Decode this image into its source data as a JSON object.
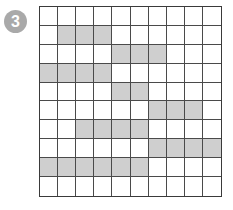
{
  "badge": {
    "label": "3",
    "color": "#a9a9a9"
  },
  "grid": {
    "rows": 10,
    "cols": 10,
    "shade_color": "#cfcfcf",
    "shaded": [
      [
        0,
        0,
        0,
        0,
        0,
        0,
        0,
        0,
        0,
        0
      ],
      [
        0,
        1,
        1,
        1,
        0,
        0,
        0,
        0,
        0,
        0
      ],
      [
        0,
        0,
        0,
        0,
        1,
        1,
        1,
        0,
        0,
        0
      ],
      [
        1,
        1,
        1,
        1,
        0,
        0,
        0,
        0,
        0,
        0
      ],
      [
        0,
        0,
        0,
        0,
        1,
        1,
        0,
        0,
        0,
        0
      ],
      [
        0,
        0,
        0,
        0,
        0,
        0,
        1,
        1,
        1,
        0
      ],
      [
        0,
        0,
        1,
        1,
        1,
        1,
        0,
        0,
        0,
        0
      ],
      [
        0,
        0,
        0,
        0,
        0,
        0,
        1,
        1,
        1,
        1
      ],
      [
        1,
        1,
        1,
        1,
        1,
        1,
        0,
        0,
        0,
        0
      ],
      [
        0,
        0,
        0,
        0,
        0,
        0,
        0,
        0,
        0,
        0
      ]
    ]
  }
}
